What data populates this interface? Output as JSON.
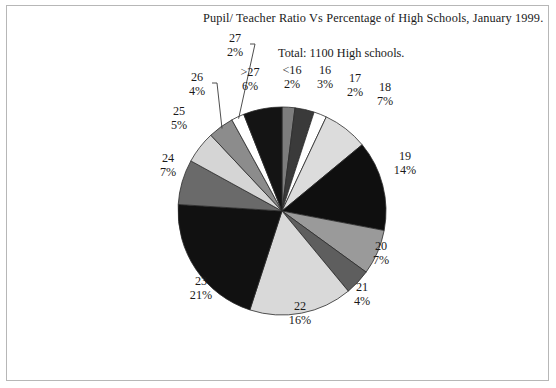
{
  "chart_data": {
    "type": "pie",
    "title": "Pupil/ Teacher Ratio Vs Percentage of High Schools, January 1999.",
    "subtitle": "Total: 1100 High schools.",
    "xlabel": "",
    "ylabel": "",
    "legend": "none",
    "grid": false,
    "start_angle_deg": 0,
    "direction": "clockwise",
    "categories": [
      "<16",
      "16",
      "17",
      "18",
      "19",
      "20",
      "21",
      "22",
      "23",
      "24",
      "25",
      "26",
      "27",
      ">27"
    ],
    "values": [
      2,
      3,
      2,
      7,
      14,
      7,
      4,
      16,
      21,
      7,
      5,
      4,
      2,
      6
    ],
    "value_suffix": "%",
    "slices": [
      {
        "category": "<16",
        "percent": 2,
        "label_category": "<16",
        "label_percent": "2%",
        "color": "#7d7d7d",
        "leader": false
      },
      {
        "category": "16",
        "percent": 3,
        "label_category": "16",
        "label_percent": "3%",
        "color": "#3a3a3a",
        "leader": false
      },
      {
        "category": "17",
        "percent": 2,
        "label_category": "17",
        "label_percent": "2%",
        "color": "#ffffff",
        "leader": false
      },
      {
        "category": "18",
        "percent": 7,
        "label_category": "18",
        "label_percent": "7%",
        "color": "#dcdcdc",
        "leader": false
      },
      {
        "category": "19",
        "percent": 14,
        "label_category": "19",
        "label_percent": "14%",
        "color": "#0f0f0f",
        "leader": false
      },
      {
        "category": "20",
        "percent": 7,
        "label_category": "20",
        "label_percent": "7%",
        "color": "#9a9a9a",
        "leader": false
      },
      {
        "category": "21",
        "percent": 4,
        "label_category": "21",
        "label_percent": "4%",
        "color": "#5e5e5e",
        "leader": false
      },
      {
        "category": "22",
        "percent": 16,
        "label_category": "22",
        "label_percent": "16%",
        "color": "#d9d9d9",
        "leader": false
      },
      {
        "category": "23",
        "percent": 21,
        "label_category": "23",
        "label_percent": "21%",
        "color": "#111111",
        "leader": false
      },
      {
        "category": "24",
        "percent": 7,
        "label_category": "24",
        "label_percent": "7%",
        "color": "#6a6a6a",
        "leader": false
      },
      {
        "category": "25",
        "percent": 5,
        "label_category": "25",
        "label_percent": "5%",
        "color": "#d5d5d5",
        "leader": false
      },
      {
        "category": "26",
        "percent": 4,
        "label_category": "26",
        "label_percent": "4%",
        "color": "#8c8c8c",
        "leader": true
      },
      {
        "category": "27",
        "percent": 2,
        "label_category": "27",
        "label_percent": "2%",
        "color": "#ffffff",
        "leader": true
      },
      {
        "category": ">27",
        "percent": 6,
        "label_category": ">27",
        "label_percent": "6%",
        "color": "#141414",
        "leader": false
      }
    ],
    "label_positions": [
      {
        "category": "<16",
        "x": 291,
        "y": 72
      },
      {
        "category": "16",
        "x": 324,
        "y": 72
      },
      {
        "category": "17",
        "x": 354,
        "y": 80
      },
      {
        "category": "18",
        "x": 384,
        "y": 89
      },
      {
        "category": "19",
        "x": 404,
        "y": 158
      },
      {
        "category": "20",
        "x": 380,
        "y": 248
      },
      {
        "category": "21",
        "x": 361,
        "y": 289
      },
      {
        "category": "22",
        "x": 299,
        "y": 308
      },
      {
        "category": "23",
        "x": 200,
        "y": 283
      },
      {
        "category": "24",
        "x": 167,
        "y": 160
      },
      {
        "category": "25",
        "x": 178,
        "y": 113
      },
      {
        "category": "26",
        "x": 196,
        "y": 79
      },
      {
        "category": ">27",
        "x": 249,
        "y": 74
      },
      {
        "category": "27",
        "x": 234,
        "y": 40
      }
    ],
    "geometry": {
      "cx": 282,
      "cy": 211,
      "r": 104
    }
  },
  "frame": {
    "border_color": "#b7b7b7"
  }
}
